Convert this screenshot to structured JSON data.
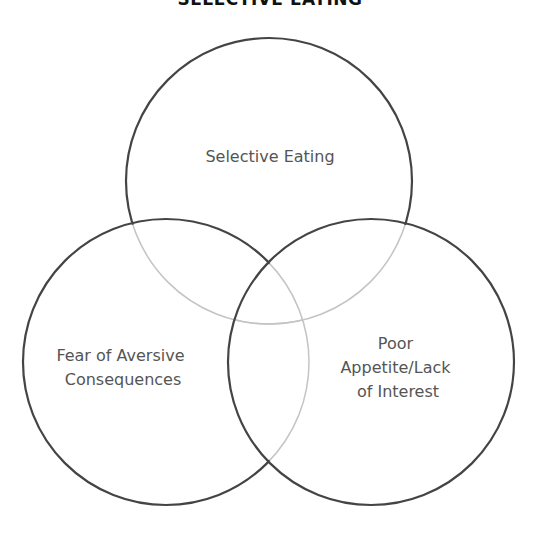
{
  "title": "SELECTIVE EATING",
  "diagram": {
    "type": "venn",
    "sets": [
      {
        "id": "top",
        "label_lines": [
          "Selective Eating"
        ]
      },
      {
        "id": "left",
        "label_lines": [
          "Fear of Aversive",
          "Consequences"
        ]
      },
      {
        "id": "right",
        "label_lines": [
          "Poor",
          "Appetite/Lack",
          "of Interest"
        ]
      }
    ],
    "colors": {
      "stroke": "#444444",
      "stroke_light": "#c4c4c4",
      "text": "#555555"
    }
  }
}
